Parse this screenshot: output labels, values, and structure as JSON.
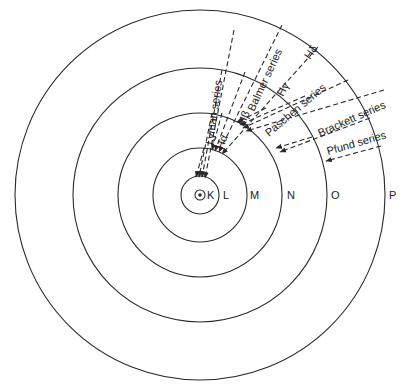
{
  "diagram": {
    "center": {
      "x": 200,
      "y": 195
    },
    "shells": [
      {
        "label": "K",
        "radius": 19,
        "label_x": 212
      },
      {
        "label": "L",
        "radius": 47,
        "label_x": 227
      },
      {
        "label": "M",
        "radius": 82,
        "label_x": 255
      },
      {
        "label": "N",
        "radius": 127,
        "label_x": 291
      },
      {
        "label": "O",
        "radius": 185,
        "label_x": 331
      },
      {
        "label": "P",
        "radius": 185,
        "label_x": 389
      }
    ],
    "shell_labels": {
      "k": "K",
      "l": "L",
      "m": "M",
      "n": "N",
      "o": "O",
      "p": "P"
    },
    "series": {
      "lyman": "Lyman series",
      "balmer": "Balmer series",
      "paschen": "Paschen series",
      "brackett": "Brackett series",
      "pfund": "Pfund series"
    },
    "line_labels": {
      "h_alpha": "Hα",
      "h_beta": "Hβ",
      "h_gamma": "Hγ",
      "h_delta": "Hδ"
    },
    "colors": {
      "stroke": "#2a2a2a",
      "background": "#ffffff"
    }
  }
}
